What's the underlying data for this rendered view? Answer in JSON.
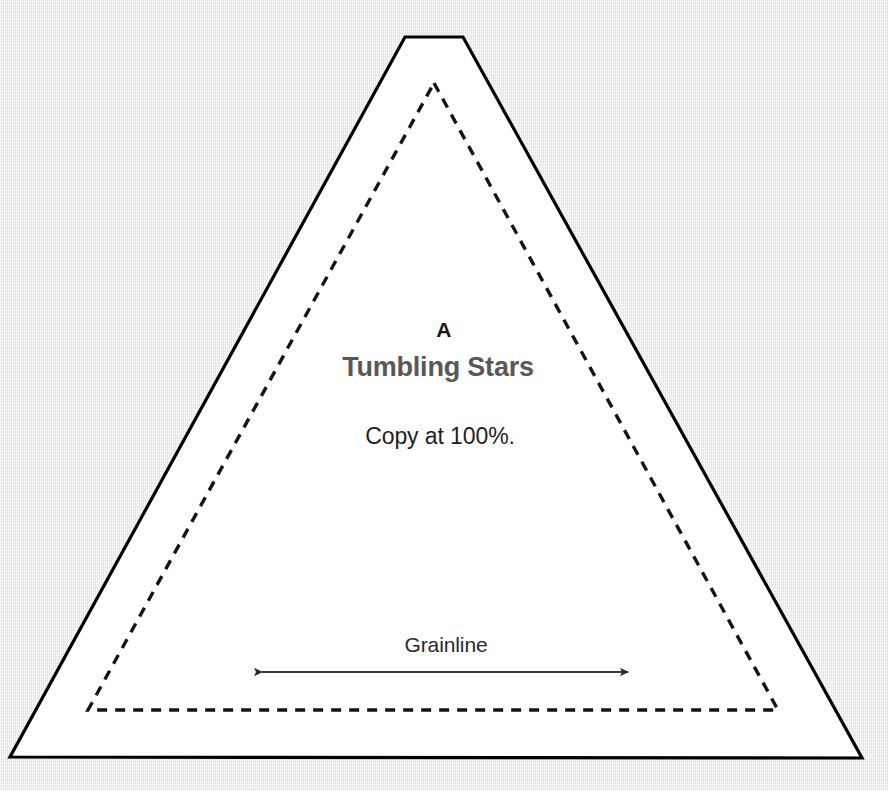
{
  "document": {
    "type": "sewing-pattern-piece",
    "background_color": "#e9e9e9",
    "paper_color": "#ffffff"
  },
  "piece": {
    "letter": "A",
    "title": "Tumbling Stars",
    "copy_note": "Copy at 100%.",
    "grainline_label": "Grainline",
    "cut_line_color": "#000000",
    "seam_line_color": "#141414",
    "title_color": "#58585a",
    "letter_color": "#1a1a1a",
    "note_color": "#1f1f1f",
    "grainline_color": "#3a3a3a"
  },
  "geometry": {
    "cut_line": {
      "shape": "truncated-triangle",
      "points": "405,37 463,37 862,758 10,757",
      "stroke_width": 3.2,
      "dash": "none"
    },
    "seam_line": {
      "shape": "triangle",
      "points": "434,83 778,710 88,710",
      "stroke_width": 3.4,
      "dash": "10 8"
    },
    "grainline_arrow": {
      "x1": 262,
      "y1": 672,
      "x2": 628,
      "y2": 672,
      "stroke_width": 2.2,
      "arrowheads": "both"
    }
  }
}
